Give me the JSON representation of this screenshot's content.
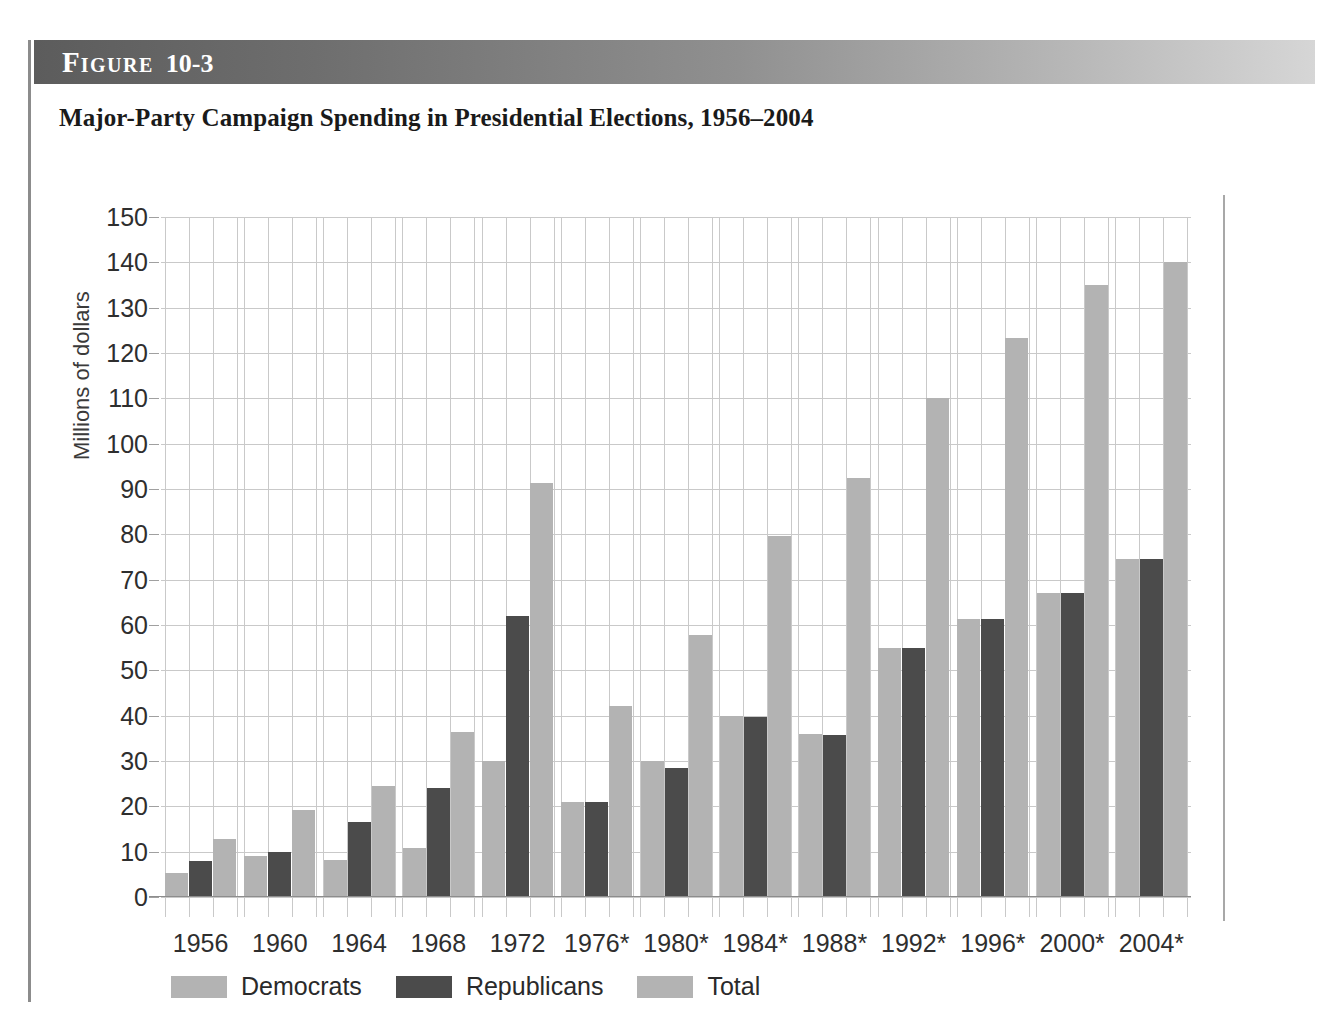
{
  "figure": {
    "label_word": "Figure",
    "number": "10-3",
    "title": "Major-Party Campaign Spending in Presidential Elections, 1956–2004"
  },
  "chart_data": {
    "type": "bar",
    "title": "Major-Party Campaign Spending in Presidential Elections, 1956–2004",
    "xlabel": "",
    "ylabel": "Millions of dollars",
    "ylim": [
      0,
      150
    ],
    "ytick_labels": [
      "150",
      "140",
      "130",
      "120",
      "110",
      "100",
      "90",
      "80",
      "70",
      "60",
      "50",
      "40",
      "30",
      "20",
      "10",
      "0"
    ],
    "ytick_values": [
      150,
      140,
      130,
      120,
      110,
      100,
      90,
      80,
      70,
      60,
      50,
      40,
      30,
      20,
      10,
      0
    ],
    "grid": true,
    "legend_position": "bottom-left",
    "categories": [
      "1956",
      "1960",
      "1964",
      "1968",
      "1972",
      "1976*",
      "1980*",
      "1984*",
      "1988*",
      "1992*",
      "1996*",
      "2000*",
      "2004*"
    ],
    "series": [
      {
        "name": "Democrats",
        "color": "#b3b3b3",
        "values": [
          5.2,
          9.0,
          8.2,
          10.8,
          30.0,
          21.0,
          30.0,
          40.0,
          36.0,
          55.0,
          61.3,
          67.0,
          74.5
        ]
      },
      {
        "name": "Republicans",
        "color": "#4b4b4b",
        "values": [
          8.0,
          10.0,
          16.5,
          24.0,
          62.0,
          21.0,
          28.5,
          39.8,
          35.8,
          55.0,
          61.3,
          67.0,
          74.5
        ]
      },
      {
        "name": "Total",
        "color": "#b3b3b3",
        "values": [
          12.8,
          19.2,
          24.5,
          36.4,
          91.4,
          42.2,
          57.8,
          79.7,
          92.5,
          110.0,
          123.3,
          135.0,
          140.0
        ]
      }
    ]
  },
  "legend": {
    "items": [
      {
        "label": "Democrats",
        "color": "#b3b3b3"
      },
      {
        "label": "Republicans",
        "color": "#4b4b4b"
      },
      {
        "label": "Total",
        "color": "#b3b3b3"
      }
    ]
  }
}
